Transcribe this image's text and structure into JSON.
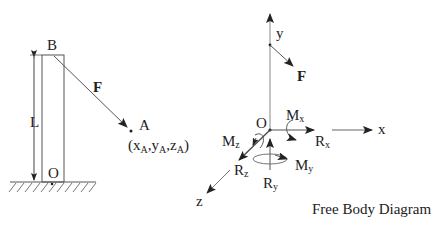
{
  "left_figure": {
    "point_top": "B",
    "point_base": "O",
    "length_label": "L",
    "force_label": "F",
    "point_a": "A",
    "point_a_coords": {
      "open": "(x",
      "xsub": "A",
      "ysep": ",y",
      "ysub": "A",
      "zsep": ",z",
      "zsub": "A",
      "close": ")"
    }
  },
  "right_figure": {
    "origin": "O",
    "axis_x": "x",
    "axis_y": "y",
    "axis_z": "z",
    "force_label": "F",
    "reactions": {
      "rx": {
        "main": "R",
        "sub": "x"
      },
      "ry": {
        "main": "R",
        "sub": "y"
      },
      "rz": {
        "main": "R",
        "sub": "z"
      }
    },
    "moments": {
      "mx": {
        "main": "M",
        "sub": "x"
      },
      "my": {
        "main": "M",
        "sub": "y"
      },
      "mz": {
        "main": "M",
        "sub": "z"
      }
    },
    "caption": "Free Body Diagram"
  }
}
